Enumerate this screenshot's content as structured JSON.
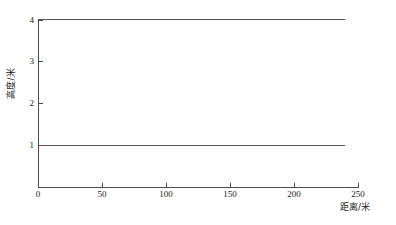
{
  "chart_data": {
    "type": "line",
    "title": "",
    "subtitle": "",
    "xlabel": "距离/米",
    "ylabel": "高度/米",
    "xlim": [
      0,
      250
    ],
    "ylim": [
      0,
      4
    ],
    "grid": false,
    "legend": null,
    "x_ticks": [
      0,
      50,
      100,
      150,
      200,
      250
    ],
    "x_tick_labels": [
      "0",
      "50",
      "100",
      "150",
      "200",
      "250"
    ],
    "y_ticks": [
      1,
      2,
      3,
      4
    ],
    "y_tick_labels": [
      "1",
      "2",
      "3",
      "4"
    ],
    "series": [
      {
        "name": "upper-line",
        "color": "#555555",
        "x": [
          0,
          240
        ],
        "values": [
          4,
          4
        ]
      },
      {
        "name": "lower-line",
        "color": "#555555",
        "x": [
          0,
          240
        ],
        "values": [
          1,
          1
        ]
      }
    ],
    "annotations": []
  },
  "axes": {
    "x_title": "距离/米",
    "y_title": "高度/米"
  },
  "x_tick_labels": {
    "t0": "0",
    "t1": "50",
    "t2": "100",
    "t3": "150",
    "t4": "200",
    "t5": "250"
  },
  "y_tick_labels": {
    "t1": "1",
    "t2": "2",
    "t3": "3",
    "t4": "4"
  }
}
